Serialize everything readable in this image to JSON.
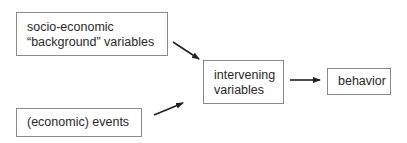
{
  "diagram": {
    "type": "flow",
    "nodes": [
      {
        "id": "background",
        "lines": [
          "socio-economic",
          "“background” variables"
        ]
      },
      {
        "id": "events",
        "lines": [
          "(economic) events"
        ]
      },
      {
        "id": "intervening",
        "lines": [
          "intervening",
          "variables"
        ]
      },
      {
        "id": "behavior",
        "lines": [
          "behavior"
        ]
      }
    ],
    "edges": [
      {
        "from": "background",
        "to": "intervening"
      },
      {
        "from": "events",
        "to": "intervening"
      },
      {
        "from": "intervening",
        "to": "behavior"
      }
    ],
    "colors": {
      "border": "#8a8a8a",
      "arrow": "#222222",
      "text": "#2a2a2a"
    }
  }
}
